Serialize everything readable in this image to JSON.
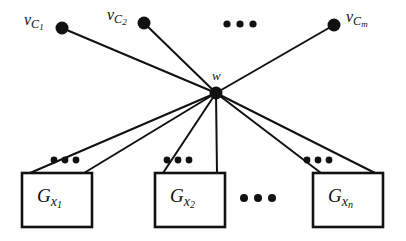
{
  "figure": {
    "background_color": "#ffffff",
    "ink_color": "#111111"
  },
  "hub": {
    "name": "w",
    "label_base": "w",
    "x": 216,
    "y": 93,
    "radius": 6.5,
    "label_x": 212,
    "label_y": 67
  },
  "clause_nodes": [
    {
      "label_base": "v",
      "label_sub1": "C",
      "label_sub2": "1",
      "x": 62,
      "y": 28,
      "radius": 6.5,
      "label_x": 24,
      "label_y": 12,
      "label_side": "left"
    },
    {
      "label_base": "v",
      "label_sub1": "C",
      "label_sub2": "2",
      "x": 144,
      "y": 23,
      "radius": 6.5,
      "label_x": 107,
      "label_y": 7,
      "label_side": "left"
    },
    {
      "label_base": "v",
      "label_sub1": "C",
      "label_sub2": "m",
      "x": 334,
      "y": 25,
      "radius": 6.5,
      "label_x": 346,
      "label_y": 9,
      "label_side": "right"
    }
  ],
  "variable_boxes": [
    {
      "label_base": "G",
      "label_sub1": "x",
      "label_sub2": "1",
      "x": 22,
      "y": 173,
      "width": 70,
      "height": 54,
      "label_x": 37,
      "label_y": 186,
      "edge_left_x": 30,
      "edge_right_x": 84,
      "dots_x": 65,
      "dots_y": 160
    },
    {
      "label_base": "G",
      "label_sub1": "x",
      "label_sub2": "2",
      "x": 155,
      "y": 173,
      "width": 70,
      "height": 54,
      "label_x": 170,
      "label_y": 186,
      "edge_left_x": 163,
      "edge_right_x": 217,
      "dots_x": 178,
      "dots_y": 160
    },
    {
      "label_base": "G",
      "label_sub1": "x",
      "label_sub2": "n",
      "x": 313,
      "y": 173,
      "width": 70,
      "height": 54,
      "label_x": 328,
      "label_y": 186,
      "edge_left_x": 321,
      "edge_right_x": 375,
      "dots_x": 318,
      "dots_y": 160
    }
  ],
  "ellipses": [
    {
      "name": "clause-row-ellipsis",
      "cx": 240,
      "cy": 24,
      "gap": 13,
      "r": 3.6
    },
    {
      "name": "box-row-ellipsis",
      "cx": 258,
      "cy": 198,
      "gap": 14,
      "r": 4.0
    }
  ],
  "strokes": {
    "edge_width": 2.0,
    "box_width": 2.6
  }
}
